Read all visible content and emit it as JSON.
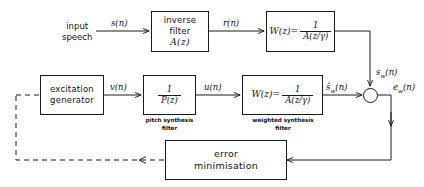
{
  "diagram": {
    "type": "signal-flow-block-diagram",
    "line_color": "#1a1a1a",
    "background": "#ffffff",
    "blocks": [
      {
        "id": "inverse-filter",
        "lines": [
          "inverse",
          "filter",
          "A(z)"
        ],
        "caption": ""
      },
      {
        "id": "weighting-filter-top",
        "lhs": "W(z)=",
        "numerator": "1",
        "denominator": "A(z/γ)",
        "caption": ""
      },
      {
        "id": "excitation-generator",
        "lines": [
          "excitation",
          "generator"
        ],
        "caption": ""
      },
      {
        "id": "pitch-synthesis-filter",
        "numerator": "1",
        "denominator": "P(z)",
        "caption_line1": "pitch synthesis",
        "caption_line2": "filter"
      },
      {
        "id": "weighted-synthesis-filter",
        "lhs": "W(z)=",
        "numerator": "1",
        "denominator": "A(z/γ)",
        "caption_line1": "weighted synthesis",
        "caption_line2": "filter"
      },
      {
        "id": "error-minimisation",
        "lines": [
          "error",
          "minimisation"
        ],
        "caption": ""
      }
    ],
    "labels": {
      "input_speech_line1": "input",
      "input_speech_line2": "speech",
      "s_n": "s(n)",
      "r_n": "r(n)",
      "v_n": "v(n)",
      "u_n": "u(n)",
      "s_w_n": "s",
      "s_w_n_sub": "w",
      "s_w_n_tail": "(n)",
      "s_hat_w_n": "ŝ",
      "s_hat_w_n_sub": "w",
      "s_hat_w_n_tail": "(n)",
      "e_w_n": "e",
      "e_w_n_sub": "w",
      "e_w_n_tail": "(n)"
    },
    "summing_junction": {
      "id": "summing-junction",
      "shape": "circle",
      "inputs": [
        "s_w(n) from top",
        "ŝ_w(n) from left"
      ],
      "output": "e_w(n)"
    },
    "feedback": {
      "style": "dashed",
      "from": "error minimisation",
      "to": "excitation generator"
    }
  }
}
